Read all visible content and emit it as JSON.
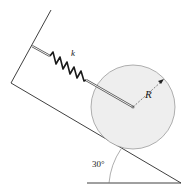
{
  "diagram": {
    "spring_label": "k",
    "radius_label": "R",
    "angle_label": "30°",
    "colors": {
      "line": "#2a2a2a",
      "disk_fill": "#eeeeee",
      "disk_stroke": "#9a9a9a",
      "spring": "#1a1a1a",
      "rod": "#555555"
    }
  }
}
